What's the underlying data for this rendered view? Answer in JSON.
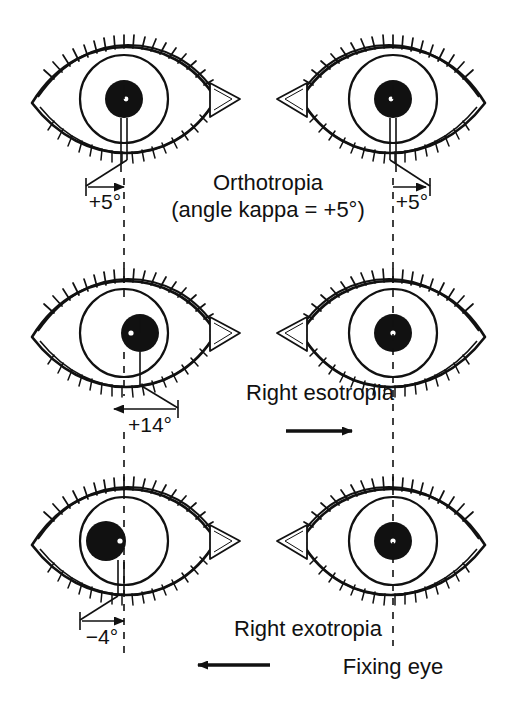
{
  "figure": {
    "title_lines": [
      "Orthotropia",
      "(angle kappa = +5°)"
    ],
    "background_color": "#ffffff",
    "ink_color": "#111111",
    "rows": [
      {
        "id": "row-orthotropia",
        "condition_label": "",
        "left_eye": {
          "name": "left-eye-orthotropia",
          "deviation_label": "+5°",
          "pupil_offset_deg": 0,
          "reflex_position": "nasal-slight",
          "fixing": false
        },
        "right_eye": {
          "name": "right-eye-orthotropia",
          "deviation_label": "+5°",
          "pupil_offset_deg": 0,
          "reflex_position": "nasal-slight",
          "fixing": true
        }
      },
      {
        "id": "row-esotropia",
        "condition_label": "Right esotropia",
        "arrow_direction": "right",
        "left_eye": {
          "name": "left-eye-esotropia",
          "deviation_label": "+14°",
          "pupil_offset_deg": 14,
          "reflex_position": "temporal",
          "fixing": false
        },
        "right_eye": {
          "name": "right-eye-esotropia-fixing",
          "deviation_label": "",
          "pupil_offset_deg": 0,
          "reflex_position": "center",
          "fixing": true
        }
      },
      {
        "id": "row-exotropia",
        "condition_label": "Right exotropia",
        "arrow_direction": "left",
        "left_eye": {
          "name": "left-eye-exotropia",
          "deviation_label": "−4°",
          "pupil_offset_deg": -4,
          "reflex_position": "nasal-edge",
          "fixing": false
        },
        "right_eye": {
          "name": "right-eye-exotropia-fixing",
          "deviation_label": "",
          "pupil_offset_deg": 0,
          "reflex_position": "center",
          "fixing": true
        }
      }
    ],
    "fixing_eye_label": "Fixing eye"
  }
}
